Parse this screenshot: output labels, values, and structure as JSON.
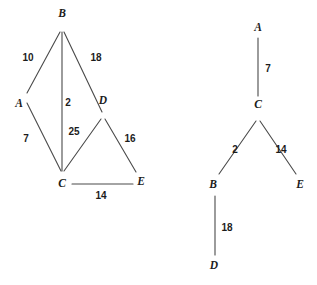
{
  "figure": {
    "background_color": "#ffffff",
    "line_color": "#4a4a4a",
    "text_color": "#1c1c1c",
    "width": 317,
    "height": 285
  },
  "graphs": [
    {
      "id": "left-graph",
      "name": "weighted-graph",
      "nodes": [
        {
          "id": "B",
          "label": "B",
          "x": 62,
          "y": 29,
          "label_x": 62,
          "label_y": 14
        },
        {
          "id": "A",
          "label": "A",
          "x": 25,
          "y": 97,
          "label_x": 19,
          "label_y": 104
        },
        {
          "id": "D",
          "label": "D",
          "x": 103,
          "y": 117,
          "label_x": 103,
          "label_y": 101
        },
        {
          "id": "C",
          "label": "C",
          "x": 62,
          "y": 173,
          "label_x": 62,
          "label_y": 184
        },
        {
          "id": "E",
          "label": "E",
          "x": 136,
          "y": 174,
          "label_x": 141,
          "label_y": 182
        }
      ],
      "edges": [
        {
          "from": "B",
          "to": "A",
          "weight": "10",
          "label_x": 28,
          "label_y": 58,
          "x1": 60,
          "y1": 32,
          "x2": 27,
          "y2": 93
        },
        {
          "from": "B",
          "to": "D",
          "weight": "18",
          "label_x": 96,
          "label_y": 58,
          "x1": 64,
          "y1": 32,
          "x2": 102,
          "y2": 112
        },
        {
          "from": "B",
          "to": "C",
          "weight": "2",
          "label_x": 68,
          "label_y": 103,
          "x1": 62,
          "y1": 32,
          "x2": 62,
          "y2": 171
        },
        {
          "from": "A",
          "to": "C",
          "weight": "7",
          "label_x": 26,
          "label_y": 139,
          "x1": 27,
          "y1": 103,
          "x2": 61,
          "y2": 171
        },
        {
          "from": "D",
          "to": "C",
          "weight": "25",
          "label_x": 74,
          "label_y": 132,
          "x1": 101,
          "y1": 119,
          "x2": 64,
          "y2": 171
        },
        {
          "from": "D",
          "to": "E",
          "weight": "16",
          "label_x": 130,
          "label_y": 139,
          "x1": 105,
          "y1": 119,
          "x2": 136,
          "y2": 172
        },
        {
          "from": "C",
          "to": "E",
          "weight": "14",
          "label_x": 101,
          "label_y": 196,
          "x1": 72,
          "y1": 184,
          "x2": 133,
          "y2": 184
        }
      ]
    },
    {
      "id": "right-graph",
      "name": "spanning-tree",
      "nodes": [
        {
          "id": "A",
          "label": "A",
          "x": 258,
          "y": 38,
          "label_x": 258,
          "label_y": 28
        },
        {
          "id": "C",
          "label": "C",
          "x": 258,
          "y": 118,
          "label_x": 258,
          "label_y": 105
        },
        {
          "id": "B",
          "label": "B",
          "x": 216,
          "y": 176,
          "label_x": 213,
          "label_y": 185
        },
        {
          "id": "E",
          "label": "E",
          "x": 298,
          "y": 176,
          "label_x": 300,
          "label_y": 185
        },
        {
          "id": "D",
          "label": "D",
          "x": 215,
          "y": 255,
          "label_x": 214,
          "label_y": 266
        }
      ],
      "edges": [
        {
          "from": "A",
          "to": "C",
          "weight": "7",
          "label_x": 268,
          "label_y": 69,
          "x1": 258,
          "y1": 38,
          "x2": 258,
          "y2": 96
        },
        {
          "from": "C",
          "to": "B",
          "weight": "2",
          "label_x": 235,
          "label_y": 150,
          "x1": 256,
          "y1": 121,
          "x2": 219,
          "y2": 174
        },
        {
          "from": "C",
          "to": "E",
          "weight": "14",
          "label_x": 281,
          "label_y": 150,
          "x1": 260,
          "y1": 121,
          "x2": 296,
          "y2": 174
        },
        {
          "from": "B",
          "to": "D",
          "weight": "18",
          "label_x": 227,
          "label_y": 228,
          "x1": 215,
          "y1": 196,
          "x2": 215,
          "y2": 255
        }
      ]
    }
  ],
  "chart_data": {
    "type": "diagram",
    "title": "",
    "left_graph": {
      "nodes": [
        "A",
        "B",
        "C",
        "D",
        "E"
      ],
      "edges": [
        {
          "u": "A",
          "v": "B",
          "w": 10
        },
        {
          "u": "B",
          "v": "D",
          "w": 18
        },
        {
          "u": "B",
          "v": "C",
          "w": 2
        },
        {
          "u": "A",
          "v": "C",
          "w": 7
        },
        {
          "u": "C",
          "v": "D",
          "w": 25
        },
        {
          "u": "D",
          "v": "E",
          "w": 16
        },
        {
          "u": "C",
          "v": "E",
          "w": 14
        }
      ]
    },
    "right_graph": {
      "nodes": [
        "A",
        "B",
        "C",
        "D",
        "E"
      ],
      "edges": [
        {
          "u": "A",
          "v": "C",
          "w": 7
        },
        {
          "u": "C",
          "v": "B",
          "w": 2
        },
        {
          "u": "C",
          "v": "E",
          "w": 14
        },
        {
          "u": "B",
          "v": "D",
          "w": 18
        }
      ]
    }
  }
}
